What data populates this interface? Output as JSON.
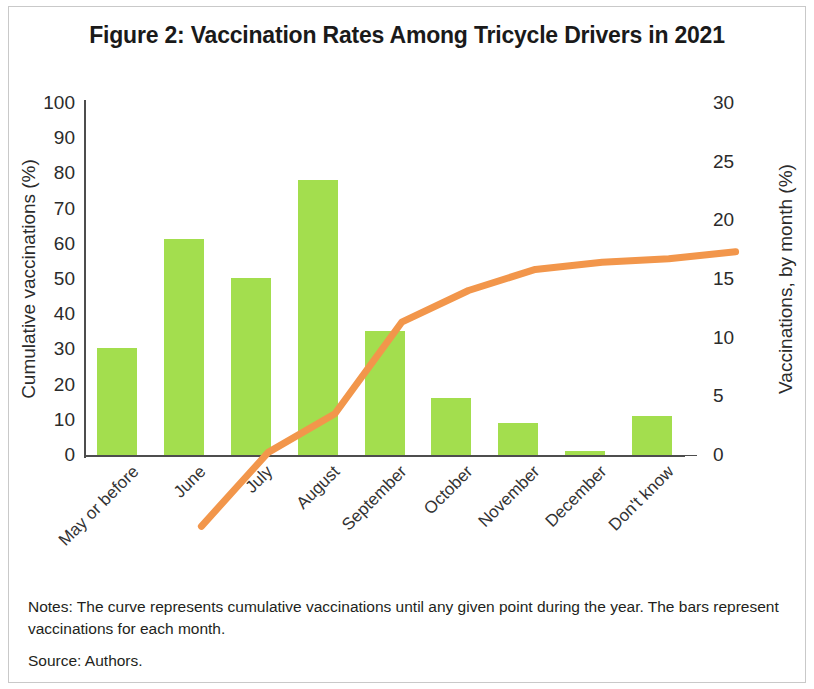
{
  "figure": {
    "title": "Figure 2: Vaccination Rates Among Tricycle Drivers in 2021",
    "notes": "Notes: The curve represents cumulative vaccinations until any given point during the year. The bars represent vaccinations for each month.",
    "source": "Source: Authors."
  },
  "chart_data": {
    "type": "bar",
    "title": "Figure 2: Vaccination Rates Among Tricycle Drivers in 2021",
    "xlabel": "",
    "ylabel": "Cumulative vaccinations (%)",
    "y2label": "Vaccinations, by month (%)",
    "ylim": [
      0,
      100
    ],
    "y2lim": [
      0,
      30
    ],
    "yticks": [
      0,
      10,
      20,
      30,
      40,
      50,
      60,
      70,
      80,
      90,
      100
    ],
    "y2ticks": [
      0,
      5,
      10,
      15,
      20,
      25,
      30
    ],
    "grid": false,
    "legend": false,
    "categories": [
      "May or before",
      "June",
      "July",
      "August",
      "September",
      "October",
      "November",
      "December",
      "Don't know"
    ],
    "series": [
      {
        "name": "Vaccinations, by month (%)",
        "type": "bar",
        "axis": "right",
        "color": "#a3de4e",
        "values": [
          9.1,
          18.4,
          15.1,
          23.4,
          10.6,
          4.9,
          2.7,
          0.3,
          3.3
        ]
      },
      {
        "name": "Cumulative vaccinations (%)",
        "type": "line",
        "axis": "left",
        "color": "#f2964b",
        "values": [
          9,
          30,
          41,
          67,
          76,
          82,
          84,
          85,
          87
        ]
      }
    ]
  },
  "colors": {
    "bar": "#a3de4e",
    "line": "#f2964b",
    "axis": "#4d4d4d",
    "text": "#2b2b2b"
  }
}
